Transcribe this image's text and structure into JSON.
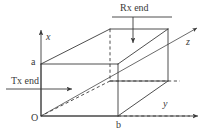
{
  "figure": {
    "background_color": "#ffffff",
    "line_color": "#3a3a3a",
    "axes": {
      "x": {
        "label": "x",
        "direction": "up"
      },
      "y": {
        "label": "y",
        "direction": "right"
      },
      "z": {
        "label": "z",
        "direction": "diagonal-up-right"
      }
    },
    "dimensions": {
      "height_label": "a",
      "width_label": "b"
    },
    "origin": {
      "label": "O"
    },
    "annotations": {
      "transmit": {
        "label": "Tx end",
        "arrow_direction": "right"
      },
      "receive": {
        "label": "Rx end",
        "arrow_direction": "down"
      }
    }
  }
}
